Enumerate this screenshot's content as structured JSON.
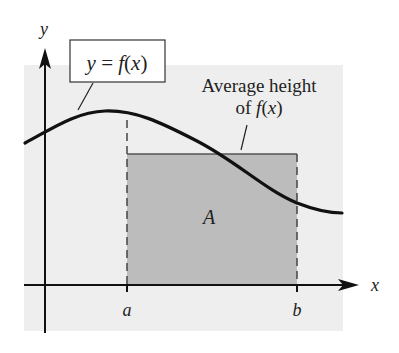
{
  "diagram": {
    "colors": {
      "panel_background": "#eeeeee",
      "rectangle_fill": "#bcbcbc",
      "stroke": "#111111",
      "page_background": "#ffffff"
    },
    "axes": {
      "x_label": "x",
      "y_label": "y"
    },
    "ticks": {
      "a_label": "a",
      "b_label": "b"
    },
    "curve_label": {
      "lhs": "y = ",
      "rhs": "f(x)"
    },
    "average_height_label": {
      "line1": "Average height",
      "line2_prefix": "of ",
      "line2_func": "f(x)"
    },
    "area_label": "A"
  }
}
